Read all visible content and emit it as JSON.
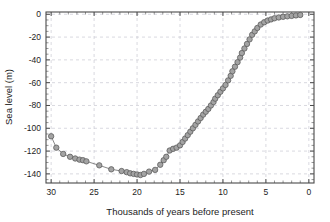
{
  "chart_data": {
    "type": "scatter",
    "title": "",
    "subtitle": "",
    "xlabel": "Thousands of years before present",
    "ylabel": "Sea level (m)",
    "xlim": [
      30.6,
      -0.6
    ],
    "ylim": [
      -148,
      2
    ],
    "x_reversed": true,
    "grid": true,
    "legend": null,
    "legend_position": "none",
    "x_ticks": [
      30,
      25,
      20,
      15,
      10,
      5,
      0
    ],
    "x_tick_labels": [
      "30",
      "25",
      "20",
      "15",
      "10",
      "5",
      "0"
    ],
    "x_minor_tick_step": 1,
    "y_ticks": [
      0,
      -20,
      -40,
      -60,
      -80,
      -100,
      -120,
      -140
    ],
    "y_tick_labels": [
      "0",
      "-20",
      "-40",
      "-60",
      "-80",
      "-100",
      "-120",
      "-140"
    ],
    "y_minor_tick_step": 5,
    "marker": "circle",
    "marker_fill": "#a3a3a3",
    "marker_edge": "#5d5d5d",
    "line_color": "#7b7b7b",
    "series": [
      {
        "name": "Sea level",
        "x": [
          30.0,
          29.4,
          28.6,
          27.8,
          27.2,
          26.7,
          26.3,
          25.9,
          24.4,
          23.0,
          21.8,
          21.2,
          20.8,
          20.4,
          20.0,
          19.6,
          19.2,
          18.6,
          17.9,
          17.3,
          16.9,
          16.6,
          16.2,
          15.8,
          15.4,
          15.0,
          14.7,
          14.4,
          14.1,
          13.8,
          13.5,
          13.2,
          12.9,
          12.6,
          12.3,
          12.0,
          11.7,
          11.4,
          11.1,
          10.9,
          10.6,
          10.3,
          10.0,
          9.7,
          9.4,
          9.1,
          8.9,
          8.6,
          8.3,
          8.0,
          7.8,
          7.5,
          7.2,
          6.9,
          6.6,
          6.3,
          6.0,
          5.6,
          5.2,
          4.8,
          4.4,
          4.0,
          3.5,
          3.0,
          2.5,
          2.0,
          1.5,
          1.0
        ],
        "y": [
          -107.0,
          -117.0,
          -122.5,
          -125.0,
          -126.5,
          -127.5,
          -128.0,
          -129.0,
          -132.5,
          -136.0,
          -137.5,
          -138.5,
          -139.5,
          -140.0,
          -140.5,
          -141.0,
          -140.0,
          -138.0,
          -136.5,
          -132.0,
          -128.0,
          -125.0,
          -119.5,
          -118.0,
          -117.0,
          -115.0,
          -112.0,
          -109.0,
          -106.0,
          -103.0,
          -100.0,
          -97.0,
          -94.0,
          -91.0,
          -88.0,
          -85.5,
          -83.0,
          -80.0,
          -77.0,
          -74.0,
          -71.0,
          -68.0,
          -65.0,
          -62.0,
          -58.0,
          -54.0,
          -50.0,
          -46.0,
          -42.0,
          -38.0,
          -34.0,
          -30.0,
          -26.0,
          -22.0,
          -18.0,
          -15.0,
          -12.0,
          -9.0,
          -7.0,
          -5.5,
          -4.5,
          -3.5,
          -2.8,
          -2.2,
          -1.8,
          -1.4,
          -1.0,
          -0.6
        ]
      }
    ]
  }
}
